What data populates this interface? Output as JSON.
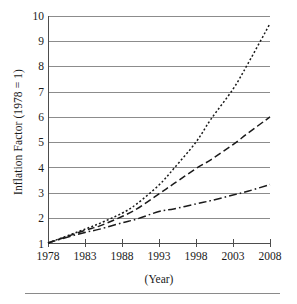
{
  "chart": {
    "title": "",
    "y_axis_label": "Inflation Factor (1978 = 1)",
    "x_axis_label": "(Year)",
    "y_ticks": [
      "1",
      "2",
      "3",
      "4",
      "5",
      "6",
      "7",
      "8",
      "9",
      "10"
    ],
    "x_ticks": [
      "1978",
      "1983",
      "1988",
      "1993",
      "1998",
      "2003",
      "2008"
    ],
    "colors": {
      "line": "#1a1a1a",
      "grid": "#8c8c8c",
      "axis": "#4d4d4d",
      "background": "#ffffff"
    }
  },
  "chart_data": {
    "type": "line",
    "title": "",
    "xlabel": "(Year)",
    "ylabel": "Inflation Factor (1978 = 1)",
    "xlim": [
      1978,
      2008
    ],
    "ylim": [
      1,
      10
    ],
    "grid": true,
    "legend": "none",
    "x": [
      1978,
      1980,
      1983,
      1985,
      1988,
      1990,
      1993,
      1995,
      1998,
      2000,
      2003,
      2005,
      2008
    ],
    "series": [
      {
        "name": "series-1",
        "style": "dotted",
        "values": [
          1.0,
          1.22,
          1.55,
          1.78,
          2.18,
          2.55,
          3.3,
          3.95,
          5.0,
          5.9,
          7.1,
          8.1,
          9.7
        ]
      },
      {
        "name": "series-2",
        "style": "dashed",
        "values": [
          1.0,
          1.2,
          1.5,
          1.68,
          2.05,
          2.35,
          2.95,
          3.35,
          3.95,
          4.3,
          4.9,
          5.35,
          6.0
        ]
      },
      {
        "name": "series-3",
        "style": "dash-dot",
        "values": [
          1.0,
          1.18,
          1.42,
          1.55,
          1.8,
          1.95,
          2.25,
          2.35,
          2.55,
          2.68,
          2.9,
          3.05,
          3.32
        ]
      }
    ]
  }
}
